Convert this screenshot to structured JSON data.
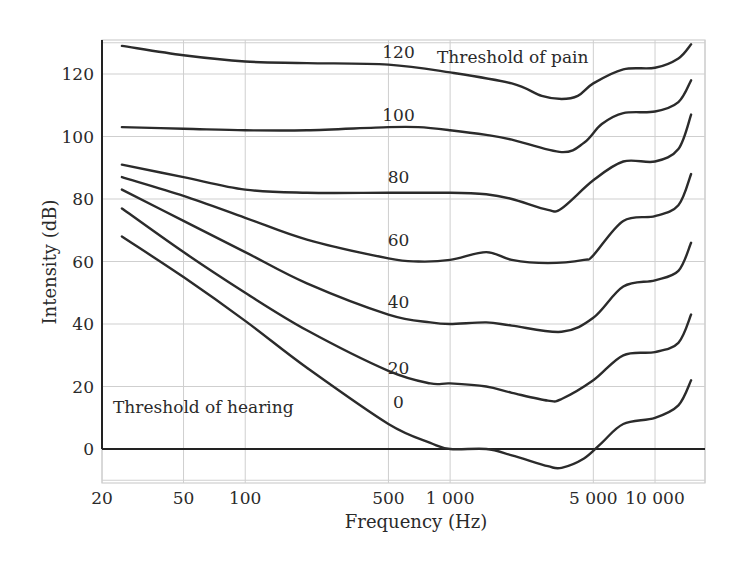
{
  "chart_data": {
    "type": "line",
    "title": "",
    "xlabel": "Frequency (Hz)",
    "ylabel": "Intensity (dB)",
    "xscale": "log",
    "xlim": [
      20,
      20000
    ],
    "ylim": [
      -10,
      130
    ],
    "grid": true,
    "x_ticks": [
      20,
      50,
      100,
      500,
      1000,
      5000,
      10000
    ],
    "x_tick_labels": [
      "20",
      "50",
      "100",
      "500",
      "1 000",
      "5 000",
      "10 000"
    ],
    "x_grid": [
      20,
      50,
      100,
      500,
      1000,
      5000,
      10000,
      20000
    ],
    "y_ticks": [
      0,
      20,
      40,
      60,
      80,
      100,
      120
    ],
    "y_tick_labels": [
      "0",
      "20",
      "40",
      "60",
      "80",
      "100",
      "120"
    ],
    "y_grid": [
      -10,
      0,
      20,
      40,
      60,
      80,
      100,
      120,
      130
    ],
    "annotations": [
      {
        "text": "Threshold of pain",
        "x": 2500,
        "y": 124
      },
      {
        "text": "Threshold of hearing",
        "x": 55,
        "y": 13
      }
    ],
    "series": [
      {
        "name": "120",
        "label_at": {
          "x": 560,
          "y": 125
        },
        "points": [
          [
            25,
            129
          ],
          [
            50,
            126
          ],
          [
            100,
            124
          ],
          [
            200,
            123.5
          ],
          [
            500,
            123
          ],
          [
            1000,
            120.5
          ],
          [
            2000,
            117
          ],
          [
            2800,
            113
          ],
          [
            3500,
            112
          ],
          [
            4200,
            113
          ],
          [
            5000,
            117
          ],
          [
            7000,
            121.5
          ],
          [
            10000,
            122
          ],
          [
            13000,
            125
          ],
          [
            15000,
            129.5
          ]
        ]
      },
      {
        "name": "100",
        "label_at": {
          "x": 560,
          "y": 105
        },
        "points": [
          [
            25,
            103
          ],
          [
            50,
            102.5
          ],
          [
            100,
            102
          ],
          [
            200,
            102
          ],
          [
            500,
            103
          ],
          [
            700,
            103
          ],
          [
            1000,
            102
          ],
          [
            1500,
            100.5
          ],
          [
            2000,
            99
          ],
          [
            3500,
            95
          ],
          [
            4500,
            98
          ],
          [
            5500,
            104
          ],
          [
            7000,
            107.5
          ],
          [
            10000,
            108
          ],
          [
            13000,
            111
          ],
          [
            15000,
            118
          ]
        ]
      },
      {
        "name": "80",
        "label_at": {
          "x": 560,
          "y": 85
        },
        "points": [
          [
            25,
            91
          ],
          [
            50,
            87
          ],
          [
            100,
            83
          ],
          [
            200,
            82
          ],
          [
            500,
            82
          ],
          [
            1000,
            82
          ],
          [
            1500,
            81.5
          ],
          [
            2000,
            80
          ],
          [
            3000,
            76.5
          ],
          [
            3500,
            77
          ],
          [
            5000,
            86
          ],
          [
            7000,
            92
          ],
          [
            10000,
            92
          ],
          [
            13000,
            96
          ],
          [
            15000,
            107
          ]
        ]
      },
      {
        "name": "60",
        "label_at": {
          "x": 560,
          "y": 65
        },
        "points": [
          [
            25,
            87
          ],
          [
            50,
            81
          ],
          [
            100,
            74
          ],
          [
            200,
            67
          ],
          [
            500,
            61
          ],
          [
            700,
            60
          ],
          [
            1000,
            60.5
          ],
          [
            1500,
            63
          ],
          [
            2000,
            60.5
          ],
          [
            3000,
            59.5
          ],
          [
            4500,
            60.5
          ],
          [
            5000,
            62
          ],
          [
            7000,
            73
          ],
          [
            10000,
            74.5
          ],
          [
            13000,
            78
          ],
          [
            15000,
            88
          ]
        ]
      },
      {
        "name": "40",
        "label_at": {
          "x": 560,
          "y": 45
        },
        "points": [
          [
            25,
            83
          ],
          [
            50,
            73
          ],
          [
            100,
            63
          ],
          [
            200,
            53
          ],
          [
            500,
            43
          ],
          [
            800,
            40.5
          ],
          [
            1000,
            40
          ],
          [
            1500,
            40.5
          ],
          [
            2000,
            39.5
          ],
          [
            3500,
            37.5
          ],
          [
            5000,
            42
          ],
          [
            7000,
            52
          ],
          [
            10000,
            54
          ],
          [
            13000,
            57
          ],
          [
            15000,
            66
          ]
        ]
      },
      {
        "name": "20",
        "label_at": {
          "x": 560,
          "y": 24
        },
        "points": [
          [
            25,
            77
          ],
          [
            50,
            63
          ],
          [
            100,
            50
          ],
          [
            200,
            38
          ],
          [
            500,
            25
          ],
          [
            800,
            21
          ],
          [
            1000,
            21
          ],
          [
            1500,
            20
          ],
          [
            2000,
            18
          ],
          [
            3000,
            15.5
          ],
          [
            3500,
            16
          ],
          [
            5000,
            22
          ],
          [
            7000,
            30
          ],
          [
            10000,
            31
          ],
          [
            13000,
            34
          ],
          [
            15000,
            43
          ]
        ]
      },
      {
        "name": "0",
        "label_at": {
          "x": 560,
          "y": 13
        },
        "points": [
          [
            25,
            68
          ],
          [
            50,
            55
          ],
          [
            100,
            41
          ],
          [
            200,
            26
          ],
          [
            500,
            8
          ],
          [
            800,
            2
          ],
          [
            1000,
            0
          ],
          [
            1500,
            0
          ],
          [
            2000,
            -2
          ],
          [
            3000,
            -5.5
          ],
          [
            3500,
            -6
          ],
          [
            4500,
            -3
          ],
          [
            5500,
            2
          ],
          [
            7000,
            8
          ],
          [
            10000,
            10
          ],
          [
            13000,
            14
          ],
          [
            15000,
            22
          ]
        ]
      }
    ]
  },
  "layout": {
    "plot_left_px": 102,
    "plot_right_px": 705,
    "plot_top_px": 40,
    "plot_bottom_px": 483,
    "colors": {
      "curve": "#2b2b2b",
      "grid": "#cfcfcf",
      "axis": "#222222",
      "text": "#2a2a2a",
      "background": "#ffffff"
    }
  }
}
